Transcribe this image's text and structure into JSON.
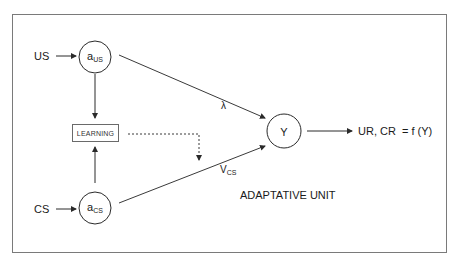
{
  "diagram": {
    "title": "ADAPTATIVE UNIT",
    "colors": {
      "line": "#3a3a3a",
      "frame": "#7a7a7a",
      "background": "#ffffff"
    },
    "inputs": [
      {
        "id": "us",
        "label": "US"
      },
      {
        "id": "cs",
        "label": "CS"
      }
    ],
    "nodes": [
      {
        "id": "a_us",
        "base": "a",
        "sub": "US",
        "shape": "circle"
      },
      {
        "id": "a_cs",
        "base": "a",
        "sub": "CS",
        "shape": "circle"
      },
      {
        "id": "y",
        "label": "Y",
        "shape": "circle"
      },
      {
        "id": "learning",
        "label": "LEARNING",
        "shape": "rectangle"
      }
    ],
    "edges": [
      {
        "from": "US",
        "to": "a_US",
        "style": "solid-arrow"
      },
      {
        "from": "CS",
        "to": "a_CS",
        "style": "solid-arrow"
      },
      {
        "from": "a_US",
        "to": "LEARNING",
        "style": "solid-arrow"
      },
      {
        "from": "a_CS",
        "to": "LEARNING",
        "style": "solid-arrow"
      },
      {
        "from": "a_US",
        "to": "Y",
        "style": "solid-arrow",
        "label": "λ"
      },
      {
        "from": "a_CS",
        "to": "Y",
        "style": "solid-arrow",
        "label_base": "V",
        "label_sub": "CS"
      },
      {
        "from": "LEARNING",
        "to": "V_CS edge",
        "style": "dashed-arrow"
      },
      {
        "from": "Y",
        "to": "output",
        "style": "solid-arrow"
      }
    ],
    "output": {
      "label": "UR, CR  = f (Y)"
    },
    "edge_labels": {
      "lambda": "λ",
      "vcs_base": "V",
      "vcs_sub": "CS"
    }
  }
}
